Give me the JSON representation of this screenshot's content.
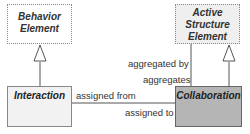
{
  "diagram": {
    "elements": [
      {
        "id": "behavior",
        "label_lines": [
          "Behavior",
          "Element"
        ],
        "style": "abstract",
        "fill": "#ffffff"
      },
      {
        "id": "active",
        "label_lines": [
          "Active",
          "Structure",
          "Element"
        ],
        "style": "abstract",
        "fill": "#efefef"
      },
      {
        "id": "interaction",
        "label": "Interaction",
        "style": "concrete",
        "fill": "#f2f2f2"
      },
      {
        "id": "collaboration",
        "label": "Collaboration",
        "style": "concrete",
        "fill": "#b5b5b5"
      }
    ],
    "relations": [
      {
        "from": "interaction",
        "to": "behavior",
        "type": "specialization"
      },
      {
        "from": "collaboration",
        "to": "active",
        "type": "specialization"
      },
      {
        "from": "collaboration",
        "to": "active",
        "type": "aggregation",
        "label_up": "aggregated by",
        "label_down": "aggregates"
      },
      {
        "from": "collaboration",
        "to": "interaction",
        "type": "assignment",
        "label_from": "assigned from",
        "label_to": "assigned to"
      }
    ],
    "labels": {
      "aggregated_by": "aggregated by",
      "aggregates": "aggregates",
      "assigned_from": "assigned from",
      "assigned_to": "assigned to"
    }
  }
}
